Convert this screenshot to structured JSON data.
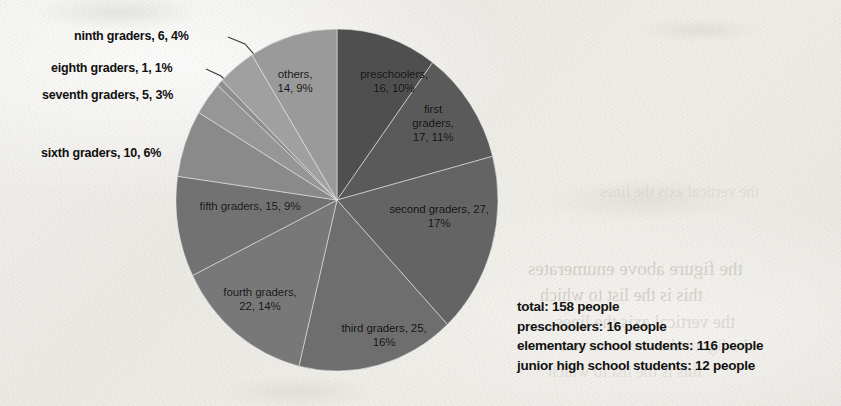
{
  "chart_data": {
    "type": "pie",
    "title": "",
    "unit": "people",
    "total": 158,
    "categories": [
      "preschoolers",
      "first graders",
      "second graders",
      "third graders",
      "fourth graders",
      "fifth graders",
      "sixth graders",
      "seventh graders",
      "eighth graders",
      "ninth graders",
      "others"
    ],
    "values": [
      16,
      17,
      27,
      25,
      22,
      15,
      10,
      5,
      1,
      6,
      14
    ],
    "percents": [
      10,
      11,
      17,
      16,
      14,
      9,
      6,
      3,
      1,
      4,
      9
    ],
    "colors": [
      "#4f4f4f",
      "#5a5a5a",
      "#646464",
      "#6e6e6e",
      "#787878",
      "#727272",
      "#8a8a8a",
      "#969696",
      "#8e8e8e",
      "#a0a0a0",
      "#9a9a9a"
    ],
    "start_angle_deg": 0,
    "direction": "clockwise",
    "legend": "none",
    "grid": false,
    "slice_labels": [
      {
        "key": "preschoolers",
        "text_line1": "preschoolers,",
        "text_line2": "16, 10%",
        "placement": "inside"
      },
      {
        "key": "first_graders",
        "text_line1": "first",
        "text_line2": "graders,",
        "text_line3": "17, 11%",
        "placement": "inside"
      },
      {
        "key": "second_graders",
        "text_line1": "second graders, 27,",
        "text_line2": "17%",
        "placement": "inside"
      },
      {
        "key": "third_graders",
        "text_line1": "third graders, 25,",
        "text_line2": "16%",
        "placement": "inside"
      },
      {
        "key": "fourth_graders",
        "text_line1": "fourth graders,",
        "text_line2": "22, 14%",
        "placement": "inside"
      },
      {
        "key": "fifth_graders",
        "text_line1": "fifth graders, 15, 9%",
        "placement": "inside"
      },
      {
        "key": "others",
        "text_line1": "others,",
        "text_line2": "14, 9%",
        "placement": "inside"
      }
    ],
    "callout_labels": [
      {
        "key": "ninth_graders",
        "text": "ninth graders, 6, 4%"
      },
      {
        "key": "eighth_graders",
        "text": "eighth graders, 1, 1%"
      },
      {
        "key": "seventh_graders",
        "text": "seventh graders, 5, 3%"
      },
      {
        "key": "sixth_graders",
        "text": "sixth graders, 10, 6%"
      }
    ]
  },
  "summary": {
    "total_line": "total: 158 people",
    "preschoolers_line": "preschoolers: 16 people",
    "elementary_line": "elementary school students: 116 people",
    "junior_high_line": "junior high school students: 12 people"
  },
  "bleed_through": {
    "line_a": "the figure above enumerates",
    "line_b": "this is the list to which",
    "line_c": "the vertical axis the lines"
  }
}
